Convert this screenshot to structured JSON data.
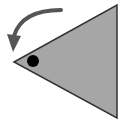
{
  "icon": {
    "name": "rotate-counterclockwise",
    "colors": {
      "background": "#ffffff",
      "triangle_fill": "#a6a6a6",
      "triangle_stroke": "#333333",
      "dot": "#000000",
      "arrow": "#555555"
    }
  }
}
